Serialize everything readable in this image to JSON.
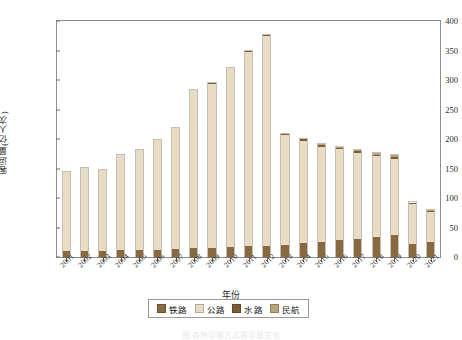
{
  "chart_data": {
    "type": "bar",
    "stacked": true,
    "title": "",
    "xlabel": "年份",
    "ylabel": "客运量(亿人次)",
    "ylim": [
      0,
      400
    ],
    "yticks": [
      0,
      50,
      100,
      150,
      200,
      250,
      300,
      350,
      400
    ],
    "grid": false,
    "legend_position": "bottom",
    "categories": [
      "2001",
      "2002",
      "2003",
      "2004",
      "2005",
      "2006",
      "2007",
      "2008",
      "2009",
      "2010",
      "2011",
      "2012",
      "2013",
      "2014",
      "2015",
      "2016",
      "2017",
      "2018",
      "2019",
      "2020",
      "2021"
    ],
    "series": [
      {
        "name": "铁路",
        "color": "#8a6a3c",
        "values": [
          10.5,
          10.6,
          9.7,
          11.2,
          11.6,
          12.6,
          13.6,
          14.6,
          15.2,
          16.8,
          18.6,
          18.9,
          21.1,
          23.6,
          25.3,
          28.1,
          30.8,
          33.8,
          36.6,
          22.0,
          26.1
        ]
      },
      {
        "name": "公路",
        "color": "#e8dcc3",
        "values": [
          134.0,
          140.8,
          139.1,
          162.4,
          169.7,
          186.0,
          205.1,
          268.2,
          277.9,
          302.8,
          328.6,
          355.7,
          185.3,
          173.3,
          161.9,
          154.3,
          145.7,
          136.7,
          130.1,
          68.9,
          50.9
        ]
      },
      {
        "name": "水路",
        "color": "#7d5c30",
        "values": [
          1.9,
          1.9,
          1.7,
          1.9,
          2.0,
          2.2,
          2.3,
          2.0,
          2.2,
          2.2,
          2.5,
          2.6,
          2.4,
          2.6,
          2.7,
          2.7,
          2.8,
          2.8,
          2.7,
          1.5,
          1.6
        ]
      },
      {
        "name": "民航",
        "color": "#bda27a",
        "values": [
          0.8,
          0.9,
          0.9,
          1.2,
          1.4,
          1.6,
          1.9,
          1.9,
          2.3,
          2.7,
          2.9,
          3.2,
          3.5,
          3.9,
          4.4,
          4.9,
          5.5,
          6.1,
          6.6,
          4.2,
          4.4
        ]
      }
    ],
    "totals": [
      147.2,
      154.2,
      151.4,
      176.7,
      184.7,
      202.4,
      222.9,
      286.7,
      297.6,
      324.5,
      352.6,
      380.4,
      212.3,
      203.4,
      194.3,
      190.0,
      184.8,
      179.4,
      176.0,
      96.6,
      83.0
    ],
    "annotations": []
  },
  "legend": {
    "items": [
      {
        "label": "铁路",
        "color": "#8a6a3c"
      },
      {
        "label": "公路",
        "color": "#e8dcc3"
      },
      {
        "label": "水路",
        "color": "#7d5c30"
      },
      {
        "label": "民航",
        "color": "#bda27a"
      }
    ]
  },
  "caption": "图   各种运输方式客运量变化"
}
